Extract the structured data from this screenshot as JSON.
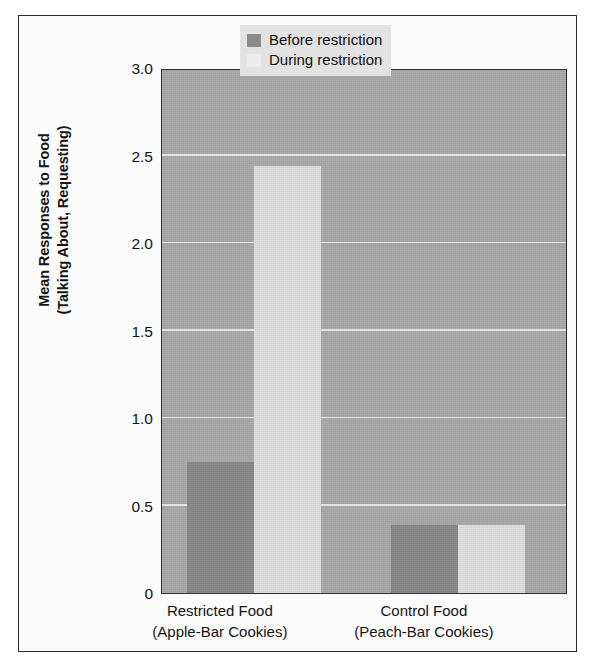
{
  "chart_data": {
    "type": "bar",
    "title": "",
    "subtitle": "",
    "xlabel": "",
    "ylabel": "Mean Responses to Food (Talking About, Requesting)",
    "ylabel_lines": [
      "Mean Responses to Food",
      "(Talking About, Requesting)"
    ],
    "categories": [
      "Restricted Food (Apple-Bar Cookies)",
      "Control Food (Peach-Bar Cookies)"
    ],
    "category_lines": [
      [
        "Restricted Food",
        "(Apple-Bar Cookies)"
      ],
      [
        "Control Food",
        "(Peach-Bar Cookies)"
      ]
    ],
    "series": [
      {
        "name": "Before restriction",
        "values": [
          0.75,
          0.39
        ],
        "color": "#878787"
      },
      {
        "name": "During restriction",
        "values": [
          2.44,
          0.39
        ],
        "color": "#dedede"
      }
    ],
    "ylim": [
      0,
      3.0
    ],
    "yticks": [
      0,
      0.5,
      1.0,
      1.5,
      2.0,
      2.5,
      3.0
    ],
    "ytick_labels": [
      "0",
      "0.5",
      "1.0",
      "1.5",
      "2.0",
      "2.5",
      "3.0"
    ],
    "grid": true,
    "gridline_color": "#f2f2f2",
    "legend_position": "top-right",
    "plot_background": "#a8a8a8",
    "figure_background": "#fbfbfb",
    "frame_color": "#2b2b2b"
  },
  "legend": {
    "entries": [
      {
        "label": "Before restriction",
        "swatch": "legend-swatch-before"
      },
      {
        "label": "During restriction",
        "swatch": "legend-swatch-during"
      }
    ]
  }
}
